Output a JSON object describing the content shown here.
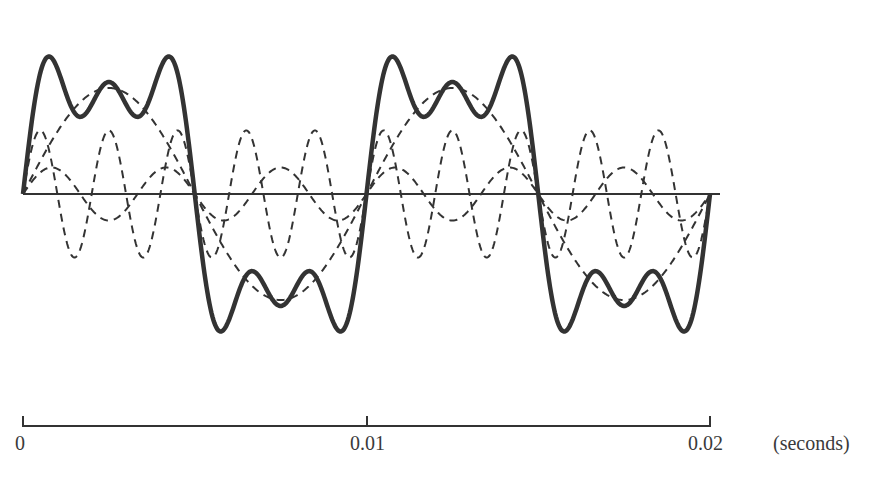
{
  "chart_data": {
    "type": "line",
    "title": "",
    "xlabel": "(seconds)",
    "ylabel": "",
    "x_ticks": [
      "0",
      "0.01",
      "0.02"
    ],
    "xlim": [
      0,
      0.02
    ],
    "grid": false,
    "legend": null,
    "zero_line": true,
    "fundamental_period_s": 0.01,
    "series": [
      {
        "name": "fundamental",
        "style": "dashed",
        "harmonic": 1,
        "relative_amplitude": 1.0,
        "phase": "sine"
      },
      {
        "name": "3rd harmonic",
        "style": "dashed",
        "harmonic": 3,
        "relative_amplitude": 0.25,
        "phase": "sine"
      },
      {
        "name": "5th harmonic",
        "style": "dashed",
        "harmonic": 5,
        "relative_amplitude": 0.6,
        "phase": "sine"
      },
      {
        "name": "sum",
        "style": "solid-thick",
        "harmonic": "1+3+5",
        "relative_amplitude": "sum of components"
      }
    ],
    "colors": {
      "ink": "#333333",
      "background": "#ffffff"
    }
  },
  "axis": {
    "tick_0": "0",
    "tick_1": "0.01",
    "tick_2": "0.02",
    "unit": "(seconds)"
  }
}
